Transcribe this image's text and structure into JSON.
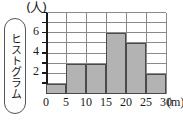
{
  "side_label": {
    "text": "ヒストグラム"
  },
  "chart_data": {
    "type": "bar",
    "title": "",
    "subtitle": "",
    "xlabel": "(m)",
    "ylabel": "(人)",
    "y_unit": "(人)",
    "x_unit": "(m)",
    "grid": true,
    "legend": null,
    "xlim": [
      0,
      30
    ],
    "ylim": [
      0,
      8
    ],
    "bin_width": 5,
    "x_tick_labels": [
      "0",
      "5",
      "10",
      "15",
      "20",
      "25",
      "30"
    ],
    "x_tick_values": [
      0,
      5,
      10,
      15,
      20,
      25,
      30
    ],
    "y_tick_values": [
      0,
      1,
      2,
      3,
      4,
      5,
      6,
      7,
      8
    ],
    "y_tick_labels": [
      "",
      "",
      "2",
      "",
      "4",
      "",
      "6",
      "",
      ""
    ],
    "y_labeled_values": [
      2,
      4,
      6
    ],
    "categories": [
      "0-5",
      "5-10",
      "10-15",
      "15-20",
      "20-25",
      "25-30"
    ],
    "values": [
      1,
      3,
      3,
      6,
      5,
      2
    ],
    "bar_fill_color": "#b3b3b3",
    "bar_edge_color": "#4a4a4a",
    "grid_color": "#8a8a8a",
    "axis_color": "#1a1a1a"
  }
}
